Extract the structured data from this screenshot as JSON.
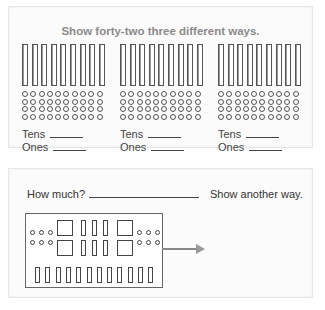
{
  "top_panel": {
    "title": "Show forty-two three different ways.",
    "groups": [
      {
        "tens_rods": 9,
        "ones_circles": 40,
        "ones_rows": 4,
        "ones_cols": 10,
        "tens_label": "Tens",
        "ones_label": "Ones"
      },
      {
        "tens_rods": 9,
        "ones_circles": 40,
        "ones_rows": 4,
        "ones_cols": 10,
        "tens_label": "Tens",
        "ones_label": "Ones"
      },
      {
        "tens_rods": 9,
        "ones_circles": 40,
        "ones_rows": 4,
        "ones_cols": 10,
        "tens_label": "Tens",
        "ones_label": "Ones"
      }
    ]
  },
  "bottom_panel": {
    "question": "How much?",
    "instruction": "Show another way.",
    "model": {
      "hundreds_squares": 4,
      "tens_rods_middle": 6,
      "ones_left": 6,
      "ones_right": 6,
      "tens_rods_bottom_row": 12
    },
    "arrow": "right-arrow"
  },
  "colors": {
    "title_text": "#8a8a8a",
    "outline": "#555555",
    "panel_border": "#e6e6e6",
    "arrow": "#888888"
  }
}
